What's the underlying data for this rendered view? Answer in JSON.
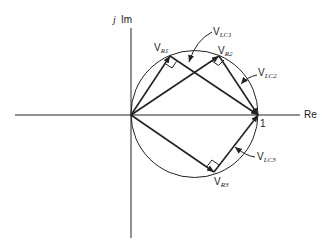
{
  "diagram": {
    "axes": {
      "real_label": "Re",
      "imag_prefix": "j",
      "imag_label": "Im",
      "unit_point_label": "1"
    },
    "circle": {
      "center_re": 0.5,
      "center_im": 0,
      "radius": 0.5
    },
    "vectors": [
      {
        "name": "V_R1",
        "main": "V",
        "sub": "R1"
      },
      {
        "name": "V_R2",
        "main": "V",
        "sub": "R2"
      },
      {
        "name": "V_R3",
        "main": "V",
        "sub": "R3"
      },
      {
        "name": "V_LC1",
        "main": "V",
        "sub": "LC1"
      },
      {
        "name": "V_LC2",
        "main": "V",
        "sub": "LC2"
      },
      {
        "name": "V_LC3",
        "main": "V",
        "sub": "LC3"
      }
    ],
    "colors": {
      "ink": "#222222",
      "background": "#ffffff"
    }
  }
}
